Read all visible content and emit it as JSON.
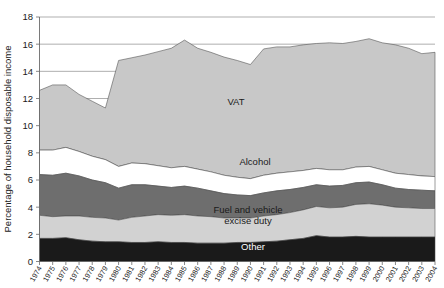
{
  "chart_data": {
    "type": "area",
    "stacked": true,
    "title": "",
    "xlabel": "",
    "ylabel": "Percentage of household disposable income",
    "ylim": [
      0,
      18
    ],
    "yticks": [
      0,
      2,
      4,
      6,
      8,
      10,
      12,
      14,
      16,
      18
    ],
    "grid": true,
    "legend_position": "inline-labels",
    "categories": [
      "1974",
      "1975",
      "1976",
      "1977",
      "1978",
      "1979",
      "1980",
      "1981",
      "1982",
      "1983",
      "1984",
      "1985",
      "1986",
      "1987",
      "1988",
      "1989",
      "1990",
      "1991",
      "1992",
      "1993",
      "1994",
      "1995",
      "1996",
      "1997",
      "1998",
      "1999",
      "2000",
      "2001",
      "2002",
      "2003",
      "2004"
    ],
    "series": [
      {
        "name": "Other",
        "color": "#1a1a1a",
        "label": "Other",
        "values": [
          1.7,
          1.7,
          1.75,
          1.6,
          1.5,
          1.45,
          1.45,
          1.4,
          1.4,
          1.45,
          1.4,
          1.4,
          1.35,
          1.35,
          1.35,
          1.4,
          1.4,
          1.45,
          1.5,
          1.6,
          1.7,
          1.9,
          1.8,
          1.8,
          1.85,
          1.8,
          1.8,
          1.8,
          1.8,
          1.8,
          1.8
        ]
      },
      {
        "name": "Fuel and vehicle excise duty",
        "color": "#d2d2d2",
        "label": "Fuel and vehicle excise duty",
        "values": [
          1.7,
          1.6,
          1.6,
          1.75,
          1.75,
          1.75,
          1.6,
          1.85,
          1.95,
          2.0,
          2.0,
          2.05,
          2.0,
          1.95,
          1.85,
          1.8,
          1.8,
          1.9,
          1.95,
          2.0,
          2.1,
          2.15,
          2.15,
          2.2,
          2.35,
          2.45,
          2.35,
          2.2,
          2.15,
          2.1,
          2.1
        ]
      },
      {
        "name": "Tobacco",
        "color": "#6e6e6e",
        "label": "Tobacco",
        "values": [
          3.0,
          3.05,
          3.15,
          2.95,
          2.75,
          2.6,
          2.35,
          2.4,
          2.3,
          2.1,
          2.05,
          2.1,
          2.05,
          1.9,
          1.8,
          1.7,
          1.65,
          1.7,
          1.75,
          1.7,
          1.65,
          1.6,
          1.6,
          1.6,
          1.6,
          1.6,
          1.5,
          1.4,
          1.35,
          1.35,
          1.3
        ]
      },
      {
        "name": "Alcohol",
        "color": "#ffffff",
        "label": "Alcohol",
        "values": [
          1.8,
          1.85,
          1.9,
          1.8,
          1.75,
          1.7,
          1.6,
          1.6,
          1.55,
          1.5,
          1.45,
          1.45,
          1.4,
          1.4,
          1.35,
          1.3,
          1.25,
          1.3,
          1.3,
          1.3,
          1.25,
          1.2,
          1.2,
          1.15,
          1.15,
          1.15,
          1.1,
          1.1,
          1.1,
          1.05,
          1.05
        ]
      },
      {
        "name": "VAT",
        "color": "#c8c8c8",
        "label": "VAT",
        "values": [
          4.4,
          4.8,
          4.6,
          4.2,
          4.05,
          3.8,
          7.8,
          7.75,
          8.0,
          8.4,
          8.8,
          9.3,
          8.9,
          8.8,
          8.7,
          8.6,
          8.4,
          9.3,
          9.3,
          9.2,
          9.25,
          9.2,
          9.35,
          9.3,
          9.25,
          9.4,
          9.35,
          9.45,
          9.3,
          9.0,
          9.15
        ]
      }
    ],
    "stack_tops": {
      "other": [
        1.7,
        1.7,
        1.75,
        1.6,
        1.5,
        1.45,
        1.45,
        1.4,
        1.4,
        1.45,
        1.4,
        1.4,
        1.35,
        1.35,
        1.35,
        1.4,
        1.4,
        1.45,
        1.5,
        1.6,
        1.7,
        1.9,
        1.8,
        1.8,
        1.85,
        1.8,
        1.8,
        1.8,
        1.8,
        1.8,
        1.8
      ],
      "fuel": [
        3.4,
        3.3,
        3.35,
        3.35,
        3.25,
        3.2,
        3.05,
        3.25,
        3.35,
        3.45,
        3.4,
        3.45,
        3.35,
        3.3,
        3.2,
        3.2,
        3.2,
        3.35,
        3.45,
        3.6,
        3.8,
        4.05,
        3.95,
        4.0,
        4.2,
        4.25,
        4.15,
        4.0,
        3.95,
        3.9,
        3.9
      ],
      "tobacco": [
        6.4,
        6.35,
        6.5,
        6.3,
        6.0,
        5.8,
        5.4,
        5.65,
        5.65,
        5.55,
        5.45,
        5.55,
        5.4,
        5.2,
        5.0,
        4.9,
        4.85,
        5.05,
        5.2,
        5.3,
        5.45,
        5.65,
        5.55,
        5.6,
        5.8,
        5.85,
        5.65,
        5.4,
        5.3,
        5.25,
        5.2
      ],
      "alcohol": [
        8.2,
        8.2,
        8.4,
        8.1,
        7.75,
        7.5,
        7.0,
        7.25,
        7.2,
        7.05,
        6.9,
        7.0,
        6.8,
        6.6,
        6.35,
        6.2,
        6.1,
        6.35,
        6.5,
        6.6,
        6.7,
        6.85,
        6.75,
        6.75,
        6.95,
        7.0,
        6.75,
        6.5,
        6.4,
        6.3,
        6.25
      ],
      "vat": [
        12.6,
        13.0,
        13.0,
        12.3,
        11.8,
        11.3,
        14.8,
        15.0,
        15.2,
        15.45,
        15.7,
        16.3,
        15.7,
        15.4,
        15.05,
        14.8,
        14.5,
        15.65,
        15.8,
        15.8,
        15.95,
        16.05,
        16.1,
        16.05,
        16.2,
        16.4,
        16.1,
        15.95,
        15.7,
        15.3,
        15.4
      ]
    }
  },
  "axis": {
    "y_title": "Percentage of household disposable income"
  }
}
